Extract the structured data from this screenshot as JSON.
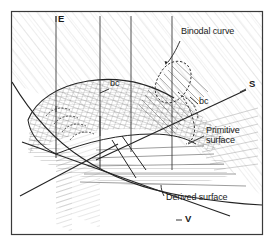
{
  "figure": {
    "domain": "Diagram",
    "kind": "thermodynamic-phase-surface-diagram",
    "title_visible": false,
    "frame": {
      "border_color": "#3a3a3a",
      "background": "#ffffff",
      "x": 11,
      "y": 11,
      "width": 252,
      "height": 224
    },
    "ink_color": "#2b2b2b",
    "hatch_color": "#8d8d8d"
  },
  "axes": [
    {
      "id": "E",
      "label": "E",
      "x": 58,
      "y": 14,
      "role": "energy-axis-label"
    },
    {
      "id": "S",
      "label": "S",
      "x": 249,
      "y": 84,
      "role": "entropy-axis-label"
    },
    {
      "id": "V",
      "label": "V",
      "x": 185,
      "y": 219,
      "role": "volume-axis-label"
    }
  ],
  "annotations": [
    {
      "id": "binodal-curve",
      "text": "Binodal curve",
      "x": 181,
      "y": 29,
      "style": "one-line",
      "leader": {
        "from": [
          180,
          42
        ],
        "to": [
          167,
          62
        ]
      }
    },
    {
      "id": "bc-left",
      "text": "bc",
      "x": 110,
      "y": 84,
      "style": "one-line",
      "leader": {
        "from": [
          108,
          90
        ],
        "to": [
          98,
          94
        ]
      }
    },
    {
      "id": "bc-right",
      "text": "bc",
      "x": 199,
      "y": 102,
      "style": "one-line",
      "leader": {
        "from": [
          198,
          103
        ],
        "to": [
          190,
          95
        ]
      }
    },
    {
      "id": "primitive-surface",
      "text": "Primitive surface",
      "x": 206,
      "y": 131,
      "style": "two-line",
      "leader": {
        "from": [
          204,
          137
        ],
        "to": [
          188,
          143
        ]
      }
    },
    {
      "id": "derived-surface",
      "text": "Derived surface",
      "x": 166,
      "y": 196,
      "style": "one-line",
      "leader": {
        "from": [
          164,
          197
        ],
        "to": [
          161,
          186
        ]
      }
    }
  ],
  "features": {
    "vertical_lines": [
      {
        "id": "vline-1",
        "x": 56,
        "y1": 16,
        "y2": 112
      },
      {
        "id": "vline-2",
        "x": 100,
        "y1": 16,
        "y2": 134
      },
      {
        "id": "vline-3",
        "x": 131,
        "y1": 16,
        "y2": 152
      },
      {
        "id": "vline-4",
        "x": 172,
        "y1": 16,
        "y2": 172
      }
    ],
    "surfaces": [
      {
        "id": "primitive-surface-region",
        "description": "cross-hatched ruled dome surface in center"
      },
      {
        "id": "derived-surface-region",
        "description": "horizontally ruled region below primitive surface"
      },
      {
        "id": "binodal-dome",
        "description": "dashed dome outline at upper right of the ruled region"
      }
    ],
    "axis_cross": {
      "x": 64,
      "y": 178,
      "description": "V and S axis crossing in lower left"
    }
  }
}
